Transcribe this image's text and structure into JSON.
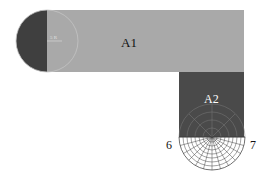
{
  "diagram": {
    "regions": [
      {
        "id": "A1",
        "label": "A1",
        "fill": "#a9a9a9"
      },
      {
        "id": "A2",
        "label": "A2",
        "fill": "#4a4a4a"
      }
    ],
    "semicircle_fill": "#3f3f3f",
    "grid_color": "#d8d8d8",
    "grid_color_light": "#6a6a6a",
    "small_label": "5 R",
    "points": [
      {
        "label": "6"
      },
      {
        "label": "7"
      }
    ]
  }
}
